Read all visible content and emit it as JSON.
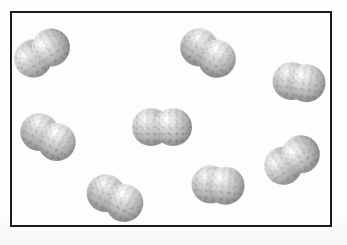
{
  "figure": {
    "width": 347,
    "height": 245,
    "caption": "",
    "background_color": "#fdfdfd",
    "border_color": "#1c1c1c"
  },
  "container": {
    "label": "gas container",
    "x": 10,
    "y": 11,
    "width": 322,
    "height": 216,
    "border_width_px": 2,
    "fill_color": "#fdfdfd"
  },
  "ghost_text": [
    {
      "text": "",
      "x": 30,
      "y": 30
    }
  ],
  "chart_data": {
    "type": "scatter",
    "title": "",
    "xlabel": "",
    "ylabel": "",
    "grid": false,
    "legend": "none",
    "note": "Particle diagram: eight identical diatomic molecules (two bonded spheres each) dispersed in a rectangular container, representing a pure diatomic gas.",
    "particle_count": 8,
    "atoms_per_particle": 2,
    "atom_color": "#b3b3b3",
    "xlim": [
      0,
      322
    ],
    "ylim": [
      0,
      216
    ],
    "molecules": [
      {
        "id": 1,
        "name": "molecule-top-left",
        "cx": 30,
        "cy": 40,
        "rotation_deg": -32,
        "atom_radius": 19,
        "bond_gap": 21
      },
      {
        "id": 2,
        "name": "molecule-top-center",
        "cx": 196,
        "cy": 40,
        "rotation_deg": 33,
        "atom_radius": 19,
        "bond_gap": 21
      },
      {
        "id": 3,
        "name": "molecule-top-right",
        "cx": 287,
        "cy": 69,
        "rotation_deg": 8,
        "atom_radius": 19,
        "bond_gap": 15
      },
      {
        "id": 4,
        "name": "molecule-left-middle",
        "cx": 36,
        "cy": 124,
        "rotation_deg": 30,
        "atom_radius": 19,
        "bond_gap": 20
      },
      {
        "id": 5,
        "name": "molecule-center",
        "cx": 150,
        "cy": 114,
        "rotation_deg": 0,
        "atom_radius": 19,
        "bond_gap": 22
      },
      {
        "id": 6,
        "name": "molecule-right-middle",
        "cx": 280,
        "cy": 147,
        "rotation_deg": -33,
        "atom_radius": 19,
        "bond_gap": 21
      },
      {
        "id": 7,
        "name": "molecule-bottom-left",
        "cx": 103,
        "cy": 185,
        "rotation_deg": 28,
        "atom_radius": 19,
        "bond_gap": 21
      },
      {
        "id": 8,
        "name": "molecule-bottom-center",
        "cx": 206,
        "cy": 172,
        "rotation_deg": 5,
        "atom_radius": 19,
        "bond_gap": 15
      }
    ]
  }
}
